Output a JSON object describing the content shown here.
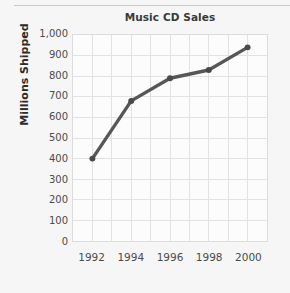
{
  "figure": {
    "background_color": "#f6f6f6",
    "plot_background_color": "#fcfcfc",
    "border_color": "#dcdcdc",
    "grid_color": "#e2e2e2",
    "line_color": "#575757",
    "title_color": "#3a3a3a",
    "tick_color": "#4b4b4b",
    "top_rule_color": "#c9c9c9"
  },
  "chart_data": {
    "type": "line",
    "title": "Music CD Sales",
    "xlabel": "",
    "ylabel": "Millions Shipped",
    "x": [
      1992,
      1994,
      1996,
      1998,
      2000
    ],
    "values": [
      400,
      680,
      790,
      830,
      940
    ],
    "x_tick_labels": [
      "1992",
      "1994",
      "1996",
      "1998",
      "2000"
    ],
    "y_tick_labels": [
      "1,000",
      "900",
      "800",
      "700",
      "600",
      "500",
      "400",
      "300",
      "200",
      "100",
      "0"
    ],
    "y_tick_values": [
      1000,
      900,
      800,
      700,
      600,
      500,
      400,
      300,
      200,
      100,
      0
    ],
    "xlim": [
      1991,
      2001
    ],
    "ylim": [
      0,
      1000
    ],
    "x_gridline_years": [
      1992,
      1993,
      1994,
      1995,
      1996,
      1997,
      1998,
      1999,
      2000
    ],
    "grid": true,
    "legend": false,
    "markers": true,
    "series": [
      {
        "name": "Music CD Sales",
        "values": [
          400,
          680,
          790,
          830,
          940
        ]
      }
    ],
    "points": [
      {
        "x": 1992,
        "y": 400
      },
      {
        "x": 1994,
        "y": 680
      },
      {
        "x": 1996,
        "y": 790
      },
      {
        "x": 1998,
        "y": 830
      },
      {
        "x": 2000,
        "y": 940
      }
    ]
  }
}
